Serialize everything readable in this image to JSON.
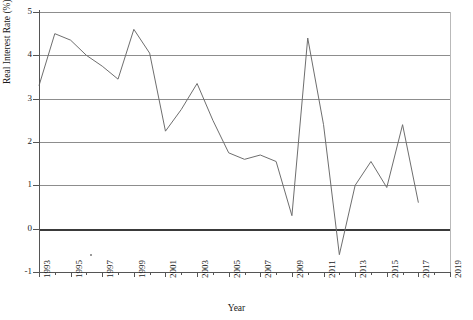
{
  "chart_data": {
    "type": "line",
    "title": "",
    "xlabel": "Year",
    "ylabel": "Real Interest Rate (%)",
    "xlim": [
      1993,
      2019
    ],
    "ylim": [
      -1,
      5
    ],
    "ytick_values": [
      -1,
      0,
      1,
      2,
      3,
      4,
      5
    ],
    "ytick_labels": [
      "-1",
      "0",
      "1",
      "2",
      "3",
      "4",
      "5"
    ],
    "xtick_values": [
      1993,
      1994,
      1995,
      1996,
      1997,
      1998,
      1999,
      2000,
      2001,
      2002,
      2003,
      2004,
      2005,
      2006,
      2007,
      2008,
      2009,
      2010,
      2011,
      2012,
      2013,
      2014,
      2015,
      2016,
      2017,
      2018,
      2019
    ],
    "xtick_labeled": [
      1993,
      1995,
      1997,
      1999,
      2001,
      2003,
      2005,
      2007,
      2009,
      2011,
      2013,
      2015,
      2017,
      2019
    ],
    "xtick_labels": [
      "1993",
      "1995",
      "1997",
      "1999",
      "2001",
      "2003",
      "2005",
      "2007",
      "2009",
      "2011",
      "2013",
      "2015",
      "2017",
      "2019"
    ],
    "grid": "horizontal",
    "legend": "none",
    "zero_line_emphasized": true,
    "line_color": "#6e6e6e",
    "grid_color": "#8d8d8d",
    "zero_line_color": "#3a3a3a",
    "x": [
      1993,
      1994,
      1995,
      1996,
      1997,
      1998,
      1999,
      2000,
      2001,
      2002,
      2003,
      2004,
      2005,
      2006,
      2007,
      2008,
      2009,
      2010,
      2011,
      2012,
      2013,
      2014,
      2015,
      2016,
      2017
    ],
    "values": [
      3.3,
      4.5,
      4.35,
      4.0,
      3.75,
      3.45,
      4.6,
      4.05,
      2.25,
      2.75,
      3.35,
      2.5,
      1.75,
      1.6,
      1.7,
      1.55,
      0.3,
      4.4,
      2.4,
      -0.6,
      1.0,
      1.55,
      0.95,
      2.4,
      0.6
    ],
    "series": [
      {
        "name": "Real Interest Rate",
        "values": [
          3.3,
          4.5,
          4.35,
          4.0,
          3.75,
          3.45,
          4.6,
          4.05,
          2.25,
          2.75,
          3.35,
          2.5,
          1.75,
          1.6,
          1.7,
          1.55,
          0.3,
          4.4,
          2.4,
          -0.6,
          1.0,
          1.55,
          0.95,
          2.4,
          0.6
        ]
      }
    ]
  }
}
